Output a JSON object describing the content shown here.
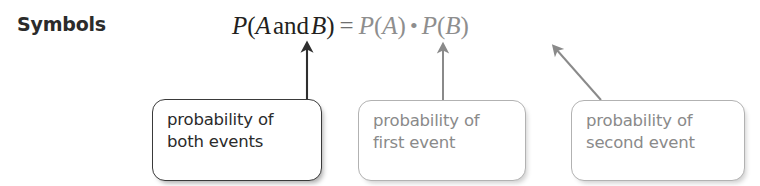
{
  "label": {
    "text": "Symbols"
  },
  "formula": {
    "lhs": {
      "p": "P",
      "open": "(",
      "event_a": "A",
      "conjunction": "and",
      "event_b": "B",
      "close": ")"
    },
    "equals": "=",
    "rhs": {
      "first_p": "P",
      "first_open": "(",
      "first_event": "A",
      "first_close": ")",
      "operator": "•",
      "second_p": "P",
      "second_open": "(",
      "second_event": "B",
      "second_close": ")"
    },
    "plain_text": "P(A and B) = P(A) • P(B)"
  },
  "callouts": [
    {
      "id": "both-events",
      "line1": "probability of",
      "line2": "both events",
      "style": "dark",
      "target": "P(A and B)",
      "arrow": "vertical"
    },
    {
      "id": "first-event",
      "line1": "probability of",
      "line2": "first event",
      "style": "light",
      "target": "P(A)",
      "arrow": "vertical"
    },
    {
      "id": "second-event",
      "line1": "probability of",
      "line2": "second event",
      "style": "light",
      "target": "P(B)",
      "arrow": "diagonal"
    }
  ],
  "colors": {
    "text_dark": "#2b2b2b",
    "text_gray": "#8a8a8a",
    "formula_dark": "#231f20",
    "formula_gray": "#8e8e8e",
    "border_dark": "#3a3a3a",
    "border_gray": "#b2b2b2",
    "background": "#ffffff"
  }
}
